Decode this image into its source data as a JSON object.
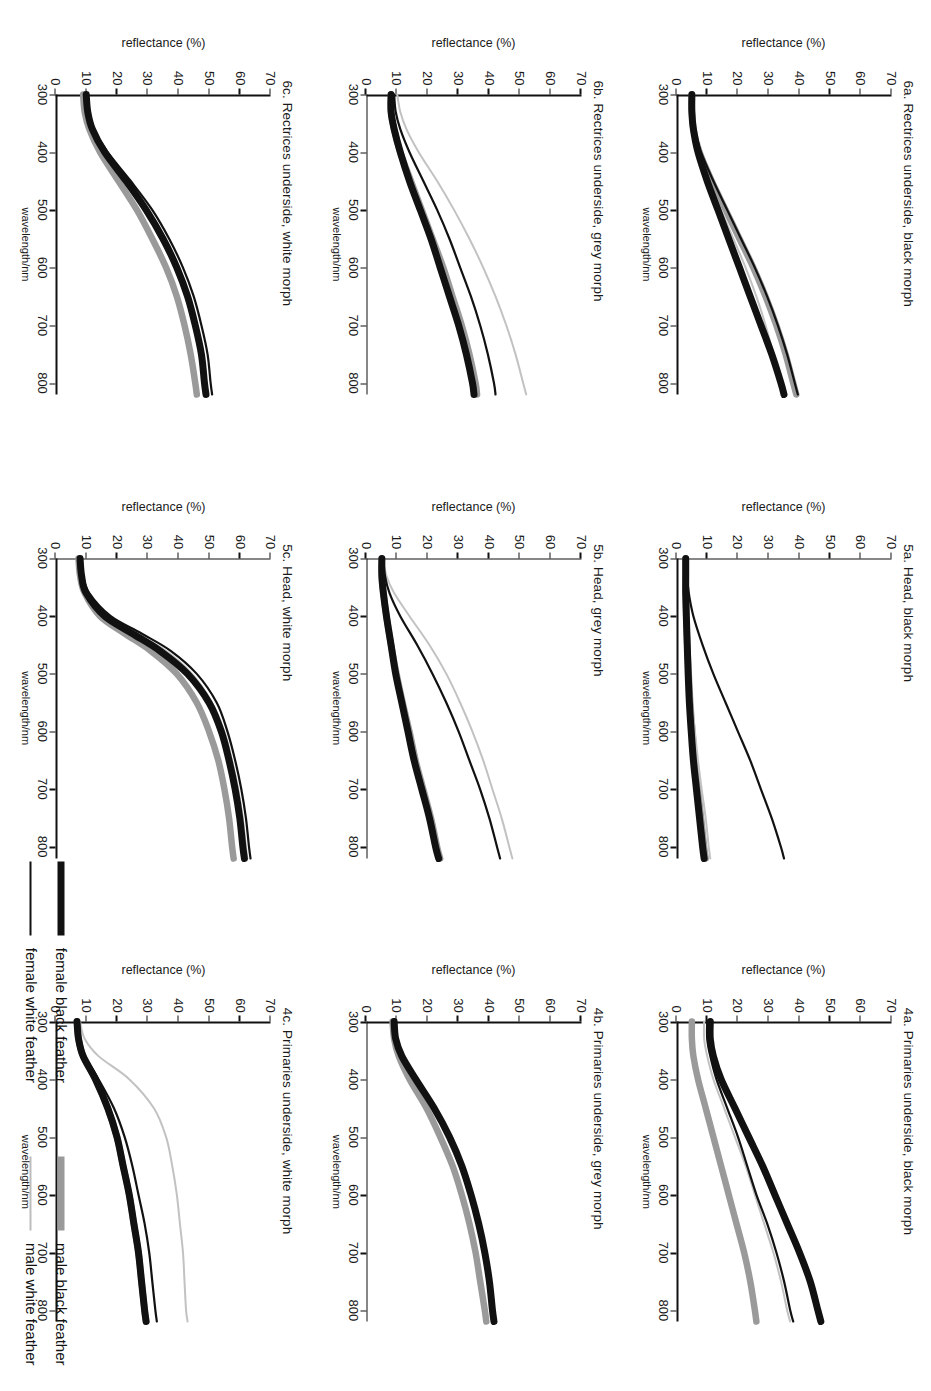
{
  "figure": {
    "axis": {
      "ylabel": "reflectance (%)",
      "xlabel": "wavelength/nm",
      "yticks": [
        "0",
        "10",
        "20",
        "30",
        "40",
        "50",
        "60",
        "70"
      ],
      "xticks": [
        "300",
        "400",
        "500",
        "600",
        "700",
        "800"
      ],
      "ylim": [
        0,
        70
      ],
      "xlim": [
        300,
        820
      ]
    },
    "legend": {
      "groups": [
        {
          "entries": [
            {
              "label": "female black feather",
              "color": "#111111",
              "width": 7
            },
            {
              "label": "female white feather",
              "color": "#111111",
              "width": 2
            }
          ]
        },
        {
          "entries": [
            {
              "label": "male black feather",
              "color": "#9a9a9a",
              "width": 7
            },
            {
              "label": "male white feather",
              "color": "#bdbdbd",
              "width": 2
            }
          ]
        }
      ]
    },
    "series_style": [
      {
        "key": "female_black",
        "color": "#111111",
        "width": 7.0
      },
      {
        "key": "female_white",
        "color": "#111111",
        "width": 2.2
      },
      {
        "key": "male_black",
        "color": "#9a9a9a",
        "width": 6.5
      },
      {
        "key": "male_white",
        "color": "#c2c2c2",
        "width": 2.0
      }
    ]
  },
  "chart_data": [
    {
      "id": "panel-6a",
      "type": "line",
      "title": "6a. Rectrices underside, black morph",
      "xlabel": "wavelength/nm",
      "ylabel": "reflectance (%)",
      "xlim": [
        300,
        820
      ],
      "ylim": [
        0,
        70
      ],
      "grid": false,
      "x": [
        300,
        330,
        360,
        400,
        450,
        500,
        550,
        600,
        650,
        700,
        750,
        800,
        820
      ],
      "series": [
        {
          "name": "female black feather",
          "values": [
            5,
            5,
            5.5,
            7,
            10,
            13.5,
            17,
            20.5,
            24,
            27.5,
            31,
            34,
            35
          ]
        },
        {
          "name": "female white feather",
          "values": [
            5,
            5,
            6,
            8,
            12,
            16.5,
            21,
            25.5,
            29.5,
            33,
            36,
            38.5,
            39.5
          ]
        },
        {
          "name": "male black feather",
          "values": [
            5,
            5,
            5.5,
            7.5,
            11.5,
            16,
            20.5,
            25,
            29,
            32.5,
            35.5,
            38,
            39
          ]
        },
        {
          "name": "male white feather",
          "values": [
            5,
            5,
            5.5,
            7,
            10.5,
            14.5,
            18.5,
            22.5,
            26,
            29,
            31.5,
            33.5,
            34.5
          ]
        }
      ]
    },
    {
      "id": "panel-5a",
      "type": "line",
      "title": "5a. Head, black morph",
      "xlabel": "wavelength/nm",
      "ylabel": "reflectance (%)",
      "xlim": [
        300,
        820
      ],
      "ylim": [
        0,
        70
      ],
      "grid": false,
      "x": [
        300,
        330,
        360,
        400,
        450,
        500,
        550,
        600,
        650,
        700,
        750,
        800,
        820
      ],
      "series": [
        {
          "name": "female black feather",
          "values": [
            3,
            3,
            3,
            3.2,
            3.5,
            3.8,
            4.2,
            4.8,
            5.5,
            6.5,
            7.5,
            8.5,
            9
          ]
        },
        {
          "name": "female white feather",
          "values": [
            3.5,
            3.5,
            4,
            5.5,
            8.5,
            12,
            16,
            20,
            24,
            27.5,
            31,
            34,
            35
          ]
        },
        {
          "name": "male black feather",
          "values": [
            3,
            3,
            3,
            3.2,
            3.5,
            4,
            4.5,
            5.2,
            6,
            7,
            8,
            9,
            9.5
          ]
        },
        {
          "name": "male white feather",
          "values": [
            3,
            3,
            3,
            3.2,
            3.6,
            4.2,
            5,
            6,
            7,
            8.2,
            9.5,
            10.5,
            11
          ]
        }
      ]
    },
    {
      "id": "panel-4a",
      "type": "line",
      "title": "4a. Primaries underside, black morph",
      "xlabel": "wavelength/nm",
      "ylabel": "reflectance (%)",
      "xlim": [
        300,
        820
      ],
      "ylim": [
        0,
        70
      ],
      "grid": false,
      "x": [
        300,
        330,
        360,
        400,
        450,
        500,
        550,
        600,
        650,
        700,
        750,
        800,
        820
      ],
      "series": [
        {
          "name": "female black feather",
          "values": [
            11,
            11,
            12,
            14.5,
            19,
            23.5,
            28,
            32,
            36,
            40,
            43.5,
            46,
            47
          ]
        },
        {
          "name": "female white feather",
          "values": [
            10,
            10,
            11,
            13,
            16.5,
            20,
            23,
            26,
            29.5,
            32.5,
            35,
            37,
            38
          ]
        },
        {
          "name": "male black feather",
          "values": [
            5,
            5,
            5.5,
            7,
            9.5,
            12,
            14.5,
            17,
            19.5,
            22,
            24,
            25.5,
            26
          ]
        },
        {
          "name": "male white feather",
          "values": [
            9,
            9,
            10,
            12,
            15.5,
            19,
            22.5,
            25.5,
            28.5,
            31.5,
            34,
            36,
            37
          ]
        }
      ]
    },
    {
      "id": "panel-6b",
      "type": "line",
      "title": "6b. Rectrices underside, grey morph",
      "xlabel": "wavelength/nm",
      "ylabel": "reflectance (%)",
      "xlim": [
        300,
        820
      ],
      "ylim": [
        0,
        70
      ],
      "grid": false,
      "x": [
        300,
        330,
        360,
        400,
        450,
        500,
        550,
        600,
        650,
        700,
        750,
        800,
        820
      ],
      "series": [
        {
          "name": "female black feather",
          "values": [
            8,
            8,
            9,
            11,
            14,
            17.5,
            21,
            24,
            27,
            30,
            32.5,
            34.5,
            35
          ]
        },
        {
          "name": "female white feather",
          "values": [
            9,
            9.5,
            11,
            14,
            18.5,
            23,
            27,
            30.5,
            34,
            37,
            39.5,
            41.5,
            42
          ]
        },
        {
          "name": "male black feather",
          "values": [
            8,
            8,
            9,
            11,
            14.5,
            18,
            21.5,
            25,
            28,
            31,
            33.5,
            35.5,
            36
          ]
        },
        {
          "name": "male white feather",
          "values": [
            10,
            11,
            13,
            17,
            23,
            28.5,
            33.5,
            38,
            42,
            45.5,
            48.5,
            51,
            52
          ]
        }
      ]
    },
    {
      "id": "panel-5b",
      "type": "line",
      "title": "5b. Head, grey morph",
      "xlabel": "wavelength/nm",
      "ylabel": "reflectance (%)",
      "xlim": [
        300,
        820
      ],
      "ylim": [
        0,
        70
      ],
      "grid": false,
      "x": [
        300,
        330,
        360,
        400,
        450,
        500,
        550,
        600,
        650,
        700,
        750,
        800,
        820
      ],
      "series": [
        {
          "name": "female black feather",
          "values": [
            5,
            5,
            5.5,
            6.5,
            8,
            9.5,
            11.5,
            13.5,
            15.5,
            18,
            20.5,
            22.5,
            23.5
          ]
        },
        {
          "name": "female white feather",
          "values": [
            5.5,
            6,
            7.5,
            11,
            16.5,
            21.5,
            26,
            30,
            33.5,
            37,
            40,
            42.5,
            43.5
          ]
        },
        {
          "name": "male black feather",
          "values": [
            5,
            5,
            5.5,
            6.5,
            8,
            9.8,
            11.8,
            14,
            16,
            18.5,
            21,
            23,
            24
          ]
        },
        {
          "name": "male white feather",
          "values": [
            5.5,
            6.5,
            9,
            14,
            20.5,
            26,
            30.5,
            34.5,
            38,
            41,
            44,
            46.5,
            47.5
          ]
        }
      ]
    },
    {
      "id": "panel-4b",
      "type": "line",
      "title": "4b. Primaries underside, grey morph",
      "xlabel": "wavelength/nm",
      "ylabel": "reflectance (%)",
      "xlim": [
        300,
        820
      ],
      "ylim": [
        0,
        70
      ],
      "grid": false,
      "x": [
        300,
        330,
        360,
        400,
        450,
        500,
        550,
        600,
        650,
        700,
        750,
        800,
        820
      ],
      "series": [
        {
          "name": "female black feather",
          "values": [
            9,
            9.5,
            11.5,
            16,
            22,
            27,
            31,
            34,
            36.5,
            38.5,
            40,
            41,
            41.5
          ]
        },
        {
          "name": "female white feather",
          "values": [
            9,
            9.5,
            11.5,
            16,
            22,
            27,
            31,
            34,
            36.5,
            38.5,
            40,
            41,
            41.5
          ]
        },
        {
          "name": "male black feather",
          "values": [
            8.5,
            9,
            10.5,
            14,
            19.5,
            24,
            28,
            31,
            33.5,
            35.5,
            37,
            38.5,
            39
          ]
        },
        {
          "name": "male white feather",
          "values": [
            9,
            9.5,
            11.5,
            16,
            22,
            27,
            31,
            34,
            36.5,
            38.5,
            40,
            41,
            41.5
          ]
        }
      ]
    },
    {
      "id": "panel-6c",
      "type": "line",
      "title": "6c. Rectrices underside, white morph",
      "xlabel": "wavelength/nm",
      "ylabel": "reflectance (%)",
      "xlim": [
        300,
        820
      ],
      "ylim": [
        0,
        70
      ],
      "grid": false,
      "x": [
        300,
        330,
        360,
        400,
        450,
        500,
        550,
        600,
        650,
        700,
        750,
        800,
        820
      ],
      "series": [
        {
          "name": "female black feather",
          "values": [
            10,
            10.5,
            12,
            16,
            23,
            29.5,
            35,
            39.5,
            43,
            45.5,
            47.5,
            48.5,
            49
          ]
        },
        {
          "name": "female white feather",
          "values": [
            10,
            10.5,
            12.5,
            17,
            24.5,
            31.5,
            37,
            41.5,
            45,
            47.5,
            49.5,
            50.5,
            51
          ]
        },
        {
          "name": "male black feather",
          "values": [
            9,
            9.5,
            11,
            14.5,
            20.5,
            26.5,
            31.5,
            36,
            39.5,
            42,
            44,
            45.5,
            46
          ]
        },
        {
          "name": "male white feather",
          "values": [
            10,
            10.5,
            12,
            16,
            23,
            29.5,
            35,
            39.5,
            43,
            45.5,
            47.5,
            48.5,
            49
          ]
        }
      ]
    },
    {
      "id": "panel-5c",
      "type": "line",
      "title": "5c. Head, white morph",
      "xlabel": "wavelength/nm",
      "ylabel": "reflectance (%)",
      "xlim": [
        300,
        820
      ],
      "ylim": [
        0,
        70
      ],
      "grid": false,
      "x": [
        300,
        330,
        360,
        400,
        430,
        460,
        500,
        550,
        600,
        650,
        700,
        750,
        800,
        820
      ],
      "series": [
        {
          "name": "female black feather",
          "values": [
            8,
            8.5,
            10,
            16,
            25,
            34,
            43,
            50,
            54,
            56.5,
            58.5,
            60,
            61,
            61.5
          ]
        },
        {
          "name": "female white feather",
          "values": [
            8.5,
            9,
            11,
            18,
            28,
            37.5,
            46,
            52.5,
            56,
            58.5,
            60.5,
            62,
            63,
            63.5
          ]
        },
        {
          "name": "male black feather",
          "values": [
            7.5,
            8,
            9.5,
            14.5,
            22.5,
            31,
            39.5,
            46,
            50,
            53,
            55,
            56.5,
            57.5,
            58
          ]
        },
        {
          "name": "male white feather",
          "values": [
            8,
            8.5,
            10.5,
            17,
            26.5,
            36,
            44.5,
            51,
            55,
            57.5,
            59.5,
            61,
            62,
            62.5
          ]
        }
      ]
    },
    {
      "id": "panel-4c",
      "type": "line",
      "title": "4c. Primaries underside, white morph",
      "xlabel": "wavelength/nm",
      "ylabel": "reflectance (%)",
      "xlim": [
        300,
        820
      ],
      "ylim": [
        0,
        70
      ],
      "grid": false,
      "x": [
        300,
        330,
        360,
        400,
        450,
        500,
        550,
        600,
        650,
        700,
        750,
        800,
        820
      ],
      "series": [
        {
          "name": "female black feather",
          "values": [
            7,
            7.5,
            9,
            13,
            17,
            20,
            22,
            24,
            25.5,
            27,
            28,
            29,
            29.5
          ]
        },
        {
          "name": "female white feather",
          "values": [
            7,
            7.5,
            9.5,
            14,
            19,
            22.5,
            25,
            27,
            29,
            30.5,
            31.5,
            32.5,
            33
          ]
        },
        {
          "name": "male black feather",
          "values": [
            7,
            7.5,
            9,
            13,
            17,
            20,
            22,
            24,
            25.5,
            27,
            28,
            29,
            29.5
          ]
        },
        {
          "name": "male white feather",
          "values": [
            8,
            9.5,
            14,
            24,
            32,
            36,
            38,
            39.5,
            40.5,
            41.5,
            42,
            42.5,
            43
          ]
        }
      ]
    }
  ]
}
